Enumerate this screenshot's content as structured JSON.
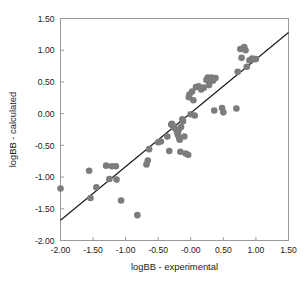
{
  "chart_data": {
    "type": "scatter",
    "title": "",
    "xlabel": "logBB - experimental",
    "ylabel": "logBB - calculated",
    "xlim": [
      -2.0,
      1.5
    ],
    "ylim": [
      -2.0,
      1.5
    ],
    "grid": false,
    "legend": null,
    "xticks": [
      -2.0,
      -1.5,
      -1.0,
      -0.5,
      0.0,
      0.5,
      1.0,
      1.5
    ],
    "yticks": [
      -2.0,
      -1.5,
      -1.0,
      -0.5,
      0.0,
      0.5,
      1.0,
      1.5
    ],
    "xtick_labels": [
      "-2.00",
      "-1.50",
      "-1.00",
      "-0.50",
      "-0.00",
      "0.50",
      "1.00",
      "1.50"
    ],
    "ytick_labels": [
      "-2.00",
      "-1.50",
      "-1.00",
      "-0.50",
      "0.00",
      "0.50",
      "1.00",
      "1.50"
    ],
    "marker": {
      "shape": "circle",
      "color": "#7c7c7c",
      "size": 4.6
    },
    "fit_line": {
      "label": "regression line",
      "color": "#171717",
      "x": [
        -2.0,
        1.5
      ],
      "y": [
        -1.68,
        1.28
      ],
      "slope": 0.846,
      "intercept": 0.012
    },
    "series": [
      {
        "name": "compounds",
        "points": [
          [
            -2.0,
            -1.18
          ],
          [
            -1.56,
            -0.9
          ],
          [
            -1.54,
            -1.33
          ],
          [
            -1.45,
            -1.16
          ],
          [
            -1.3,
            -0.82
          ],
          [
            -1.25,
            -1.03
          ],
          [
            -1.21,
            -0.83
          ],
          [
            -1.15,
            -0.83
          ],
          [
            -1.14,
            -1.04
          ],
          [
            -1.07,
            -1.37
          ],
          [
            -0.82,
            -1.6
          ],
          [
            -0.68,
            -0.8
          ],
          [
            -0.66,
            -0.74
          ],
          [
            -0.64,
            -0.56
          ],
          [
            -0.5,
            -0.45
          ],
          [
            -0.46,
            -0.44
          ],
          [
            -0.36,
            -0.36
          ],
          [
            -0.33,
            -0.59
          ],
          [
            -0.3,
            -0.17
          ],
          [
            -0.29,
            -0.16
          ],
          [
            -0.28,
            -0.18
          ],
          [
            -0.26,
            -0.22
          ],
          [
            -0.22,
            -0.25
          ],
          [
            -0.21,
            -0.29
          ],
          [
            -0.2,
            -0.33
          ],
          [
            -0.19,
            -0.27
          ],
          [
            -0.18,
            -0.38
          ],
          [
            -0.17,
            -0.41
          ],
          [
            -0.16,
            -0.6
          ],
          [
            -0.15,
            -0.21
          ],
          [
            -0.13,
            -0.09
          ],
          [
            -0.12,
            -0.12
          ],
          [
            -0.1,
            -0.36
          ],
          [
            -0.08,
            -0.63
          ],
          [
            -0.04,
            -0.65
          ],
          [
            -0.03,
            0.26
          ],
          [
            -0.02,
            0.3
          ],
          [
            0.0,
            -0.01
          ],
          [
            0.02,
            0.35
          ],
          [
            0.04,
            0.21
          ],
          [
            0.06,
            -0.03
          ],
          [
            0.08,
            0.42
          ],
          [
            0.12,
            0.43
          ],
          [
            0.16,
            0.38
          ],
          [
            0.2,
            0.41
          ],
          [
            0.24,
            0.53
          ],
          [
            0.26,
            0.57
          ],
          [
            0.28,
            0.45
          ],
          [
            0.3,
            0.55
          ],
          [
            0.32,
            0.57
          ],
          [
            0.34,
            0.52
          ],
          [
            0.36,
            0.05
          ],
          [
            0.38,
            0.56
          ],
          [
            0.48,
            0.09
          ],
          [
            0.5,
            0.02
          ],
          [
            0.7,
            0.08
          ],
          [
            0.72,
            0.66
          ],
          [
            0.76,
            1.02
          ],
          [
            0.78,
            0.88
          ],
          [
            0.82,
            1.05
          ],
          [
            0.84,
            1.0
          ],
          [
            0.86,
            0.74
          ],
          [
            0.9,
            0.84
          ],
          [
            0.94,
            0.87
          ],
          [
            0.98,
            0.86
          ],
          [
            1.0,
            0.86
          ]
        ]
      }
    ]
  }
}
